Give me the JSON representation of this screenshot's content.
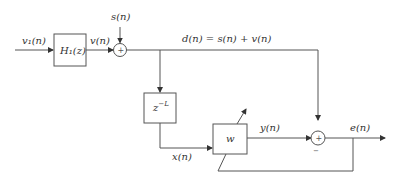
{
  "diagram": {
    "signals": {
      "input": "v₁(n)",
      "filtered": "v(n)",
      "source": "s(n)",
      "desired": "d(n) = s(n) + v(n)",
      "delayed": "x(n)",
      "output": "y(n)",
      "error": "e(n)"
    },
    "blocks": {
      "filter": "H₁(z)",
      "delay": "z",
      "delay_exp": "−L",
      "adaptive": "w"
    },
    "summers": {
      "sum1_sign": "+",
      "sum2_sign": "+",
      "sum2_minus": "−"
    }
  }
}
